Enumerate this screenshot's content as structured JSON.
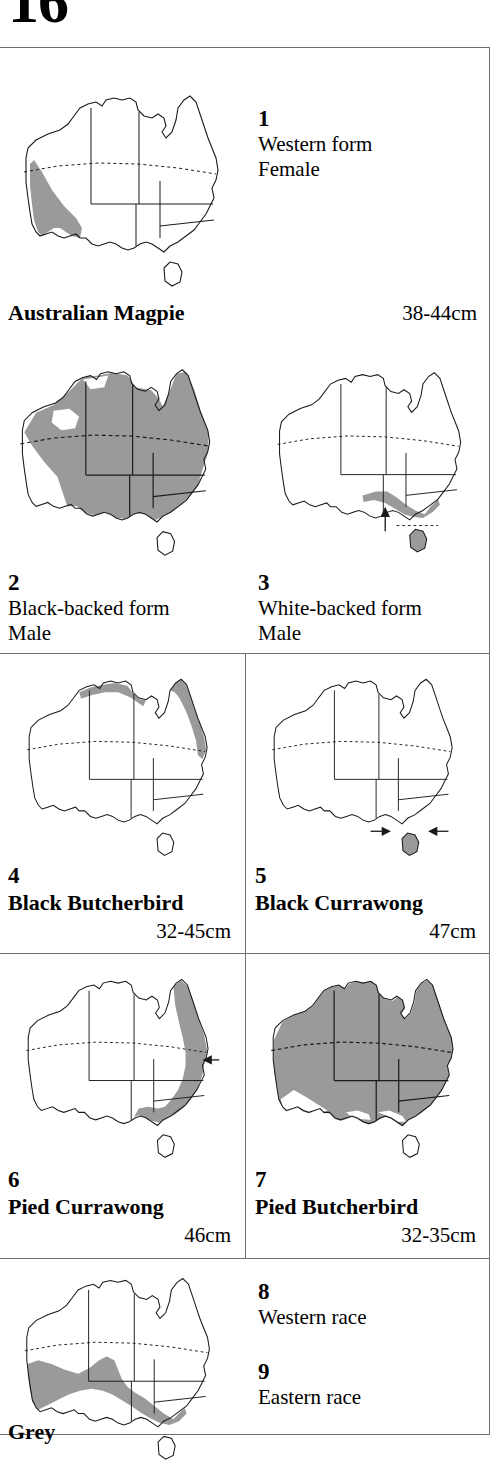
{
  "page": {
    "number": "16",
    "shade_color": "#9a9a9a",
    "outline_color": "#1a1a1a",
    "frame_color": "#6f6f73"
  },
  "entries": [
    {
      "number": "1",
      "lines": [
        "Western form",
        "Female"
      ],
      "map_name": "distribution-map-western-form-female",
      "regions": [
        "southwest"
      ],
      "markers": []
    },
    {
      "number": "2",
      "lines": [
        "Black-backed form",
        "Male"
      ],
      "map_name": "distribution-map-black-backed-form-male",
      "regions": [
        "north-band",
        "central-east",
        "southeast-broad"
      ],
      "markers": []
    },
    {
      "number": "3",
      "lines": [
        "White-backed form",
        "Male"
      ],
      "map_name": "distribution-map-white-backed-form-male",
      "regions": [
        "south-coast-strip",
        "tasmania"
      ],
      "markers": [
        "arrow-up"
      ]
    },
    {
      "number": "4",
      "lines": [],
      "map_name": "distribution-map-black-butcherbird",
      "regions": [
        "top-end-strip",
        "cape-york-east-coast"
      ],
      "markers": []
    },
    {
      "number": "5",
      "lines": [],
      "map_name": "distribution-map-black-currawong",
      "regions": [
        "tasmania"
      ],
      "markers": [
        "arrow-right",
        "arrow-left"
      ]
    },
    {
      "number": "6",
      "lines": [],
      "map_name": "distribution-map-pied-currawong",
      "regions": [
        "east-coast-broad"
      ],
      "markers": [
        "arrow-left-edge"
      ]
    },
    {
      "number": "7",
      "lines": [],
      "map_name": "distribution-map-pied-butcherbird",
      "regions": [
        "almost-all"
      ],
      "markers": []
    },
    {
      "number": "8",
      "lines": [
        "Western race"
      ],
      "map_name": "distribution-map-grey-western-race",
      "regions": [],
      "markers": []
    },
    {
      "number": "9",
      "lines": [
        "Eastern race"
      ],
      "map_name": "distribution-map-grey-eastern-race",
      "regions": [],
      "markers": []
    }
  ],
  "species": [
    {
      "name": "Australian Magpie",
      "size": "38-44cm"
    },
    {
      "name": "Black Butcherbird",
      "size": "32-45cm"
    },
    {
      "name": "Black Currawong",
      "size": "47cm"
    },
    {
      "name": "Pied Currawong",
      "size": "46cm"
    },
    {
      "name": "Pied Butcherbird",
      "size": "32-35cm"
    },
    {
      "name": "Grey",
      "size": ""
    }
  ],
  "bottom_map": {
    "map_name": "distribution-map-grey-butcherbird",
    "regions": [
      "south-west-band",
      "southeast-strip"
    ],
    "markers": []
  }
}
